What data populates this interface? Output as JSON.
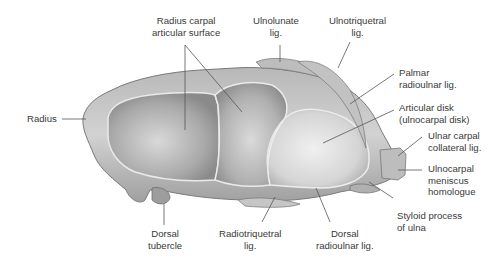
{
  "figure": {
    "labels": {
      "radius_carpal_articular_surface": "Radius carpal\narticular surface",
      "ulnolunate_lig": "Ulnolunate\nlig.",
      "ulnotriquetral_lig": "Ulnotriquetral\nlig.",
      "palmar_radioulnar_lig": "Palmar\nradioulnar lig.",
      "articular_disk": "Articular disk\n(ulnocarpal disk)",
      "ulnar_carpal_collateral_lig": "Ulnar carpal\ncollateral lig.",
      "ulnocarpal_meniscus_homologue": "Ulnocarpal\nmeniscus\nhomologue",
      "styloid_process_of_ulna": "Styloid process\nof ulna",
      "dorsal_radioulnar_lig": "Dorsal\nradioulnar lig.",
      "radiotriquetral_lig": "Radiotriquetral\nlig.",
      "dorsal_tubercle": "Dorsal\ntubercle",
      "radius": "Radius"
    },
    "colors": {
      "bone": "#c9c9c9",
      "bone_dark": "#8e8e8e",
      "cartilage": "#b8b8b8",
      "disk": "#e2e2e2",
      "leader_line": "#555555",
      "text": "#3a3a3a"
    }
  }
}
